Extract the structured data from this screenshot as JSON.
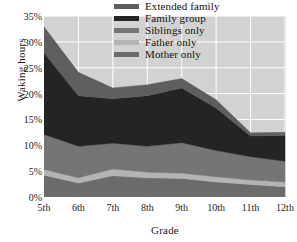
{
  "chart_data": {
    "type": "area",
    "stacked": true,
    "title": "",
    "xlabel": "Grade",
    "ylabel": "Waking hours",
    "categories": [
      "5th",
      "6th",
      "7th",
      "8th",
      "9th",
      "10th",
      "11th",
      "12th"
    ],
    "x_tick_labels": [
      "5th",
      "6th",
      "7th",
      "8th",
      "9th",
      "10th",
      "11th",
      "12th"
    ],
    "y_tick_labels": [
      "0%",
      "5%",
      "10%",
      "15%",
      "20%",
      "25%",
      "30%",
      "35%"
    ],
    "y_tick_values": [
      0,
      5,
      10,
      15,
      20,
      25,
      30,
      35
    ],
    "ylim": [
      0,
      35
    ],
    "y_unit": "%",
    "grid": true,
    "grid_color": "#ffffff",
    "plot_background": "#d2d2d2",
    "legend_position": "top-right",
    "series": [
      {
        "name": "Mother only",
        "color": "#6b6b6b",
        "values": [
          4.2,
          2.7,
          4.1,
          3.7,
          3.6,
          2.9,
          2.4,
          2.0
        ]
      },
      {
        "name": "Father only",
        "color": "#b4b4b4",
        "values": [
          1.1,
          1.0,
          1.3,
          1.1,
          1.0,
          1.0,
          0.9,
          0.9
        ]
      },
      {
        "name": "Siblings only",
        "color": "#757575",
        "values": [
          6.8,
          6.1,
          5.0,
          5.0,
          5.9,
          5.1,
          4.5,
          4.0
        ]
      },
      {
        "name": "Family group",
        "color": "#242424",
        "values": [
          15.8,
          9.8,
          8.6,
          9.8,
          10.6,
          8.2,
          4.0,
          5.0
        ]
      },
      {
        "name": "Extended family",
        "color": "#5e5e5e",
        "values": [
          5.0,
          4.5,
          2.1,
          2.1,
          1.8,
          1.6,
          0.6,
          0.6
        ]
      }
    ],
    "annotations": []
  },
  "legend": {
    "items": [
      {
        "label": "Extended family",
        "color": "#5e5e5e"
      },
      {
        "label": "Family group",
        "color": "#242424"
      },
      {
        "label": "Siblings only",
        "color": "#757575"
      },
      {
        "label": "Father only",
        "color": "#b4b4b4"
      },
      {
        "label": "Mother only",
        "color": "#6b6b6b"
      }
    ]
  }
}
